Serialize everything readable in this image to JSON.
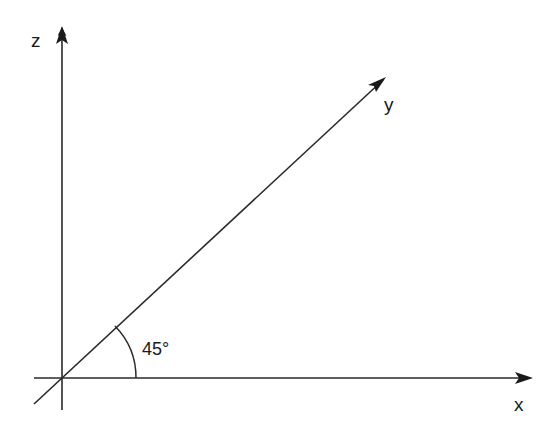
{
  "diagram": {
    "axes": {
      "x": {
        "label": "x"
      },
      "y": {
        "label": "y"
      },
      "z": {
        "label": "z"
      }
    },
    "angle": {
      "label": "45°",
      "value_degrees": 45,
      "between": [
        "x",
        "y"
      ]
    },
    "colors": {
      "line": "#2a2a2a",
      "text": "#1a1a1a",
      "background": "#ffffff"
    }
  }
}
